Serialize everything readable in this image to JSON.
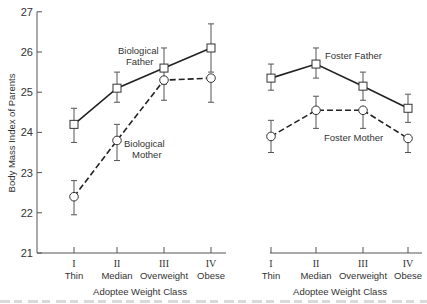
{
  "chart_data": [
    {
      "type": "line",
      "panel": "biological",
      "title": "",
      "xlabel": "Adoptee Weight Class",
      "ylabel": "Body Mass Index of Parents",
      "ylim": [
        21,
        27
      ],
      "yticks": [
        21,
        22,
        23,
        24,
        25,
        26,
        27
      ],
      "grid": false,
      "categories": [
        "I",
        "II",
        "III",
        "IV"
      ],
      "category_names": [
        "Thin",
        "Median",
        "Overweight",
        "Obese"
      ],
      "series": [
        {
          "name": "Biological Father",
          "style": "solid",
          "marker": "square",
          "values": [
            24.2,
            25.1,
            25.6,
            26.1
          ],
          "error_low": [
            23.75,
            24.75,
            25.2,
            25.5
          ],
          "error_high": [
            24.6,
            25.5,
            26.1,
            26.7
          ]
        },
        {
          "name": "Biological Mother",
          "style": "dashed",
          "marker": "circle",
          "values": [
            22.4,
            23.8,
            25.3,
            25.35
          ],
          "error_low": [
            21.95,
            23.3,
            24.8,
            24.75
          ],
          "error_high": [
            22.8,
            24.2,
            25.3,
            25.35
          ]
        }
      ],
      "annotations": [
        {
          "text": "Biological Father",
          "near": "III"
        },
        {
          "text": "Biological Mother",
          "near": "II"
        }
      ]
    },
    {
      "type": "line",
      "panel": "foster",
      "title": "",
      "xlabel": "Adoptee Weight Class",
      "ylabel": "",
      "ylim": [
        21,
        27
      ],
      "grid": false,
      "categories": [
        "I",
        "II",
        "III",
        "IV"
      ],
      "category_names": [
        "Thin",
        "Median",
        "Overweight",
        "Obese"
      ],
      "series": [
        {
          "name": "Foster Father",
          "style": "solid",
          "marker": "square",
          "values": [
            25.35,
            25.7,
            25.15,
            24.6
          ],
          "error_low": [
            25.05,
            25.35,
            24.8,
            24.25
          ],
          "error_high": [
            25.7,
            26.1,
            25.5,
            24.95
          ]
        },
        {
          "name": "Foster Mother",
          "style": "dashed",
          "marker": "circle",
          "values": [
            23.9,
            24.55,
            24.55,
            23.85
          ],
          "error_low": [
            23.5,
            24.1,
            24.1,
            23.5
          ],
          "error_high": [
            24.3,
            24.9,
            24.55,
            23.85
          ]
        }
      ],
      "annotations": [
        {
          "text": "Foster Father",
          "near": "II"
        },
        {
          "text": "Foster Mother",
          "near": "III"
        }
      ]
    }
  ],
  "labels": {
    "ylabel": "Body Mass Index of Parents",
    "xlabel_left": "Adoptee Weight Class",
    "xlabel_right": "Adoptee Weight Class",
    "bio_father_line1": "Biological",
    "bio_father_line2": "Father",
    "bio_mother_line1": "Biological",
    "bio_mother_line2": "Mother",
    "foster_father": "Foster Father",
    "foster_mother": "Foster Mother"
  },
  "layout": {
    "y_px_per_unit": 40.2,
    "y_at_21": 253,
    "left_axis_x": 37,
    "left_axis_end_x": 226,
    "left_x": [
      74,
      117,
      164,
      211
    ],
    "right_axis_start_x": 270,
    "right_axis_end_x": 422,
    "right_x": [
      271,
      316,
      363,
      408
    ]
  }
}
